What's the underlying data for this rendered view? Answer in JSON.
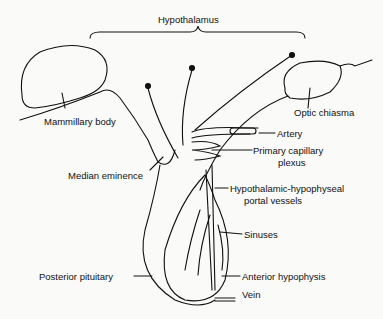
{
  "diagram": {
    "title": "Hypothalamus",
    "labels": {
      "mammillary_body": "Mammillary body",
      "optic_chiasma": "Optic chiasma",
      "artery": "Artery",
      "primary_capillary_1": "Primary capillary",
      "primary_capillary_2": "plexus",
      "median_eminence": "Median eminence",
      "portal_1": "Hypothalamic-hypophyseal",
      "portal_2": "portal vessels",
      "sinuses": "Sinuses",
      "posterior_pituitary": "Posterior pituitary",
      "anterior_hypophysis": "Anterior hypophysis",
      "vein": "Vein"
    },
    "colors": {
      "ink": "#111111",
      "background": "#fafaf8"
    }
  }
}
